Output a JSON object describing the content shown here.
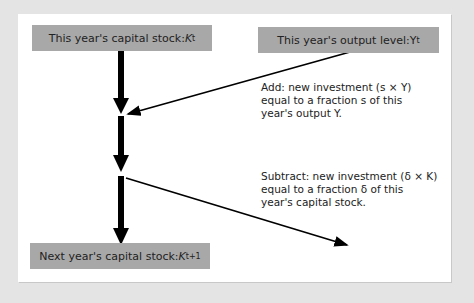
{
  "boxes": {
    "capital_now": {
      "label": "This year's capital stock: ",
      "var": "K",
      "sub": "t"
    },
    "output_now": {
      "label": "This year's output level: ",
      "var": "Y",
      "sub": "t"
    },
    "capital_next": {
      "label": "Next year's capital stock: ",
      "var": "K",
      "sub": "t+1"
    }
  },
  "notes": {
    "add": [
      "Add: new investment (s × Y)",
      "equal to a fraction s of this",
      "year's output Y."
    ],
    "subtract": [
      "Subtract: new investment (δ × K)",
      "equal to a fraction δ of this",
      "year's capital stock."
    ]
  },
  "colors": {
    "box": "#a8a8a8",
    "background": "#e4e4e4",
    "panel": "#ffffff",
    "arrow": "#000000"
  }
}
